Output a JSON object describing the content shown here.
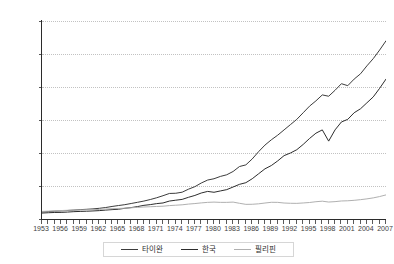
{
  "chart_data": {
    "type": "line",
    "title": "",
    "xlabel": "",
    "ylabel": "",
    "ylim": [
      0,
      30000
    ],
    "xlim": [
      1953,
      2007
    ],
    "grid": true,
    "legend_position": "bottom-center",
    "y_ticks": [
      "0",
      "5,000",
      "10,000",
      "15,000",
      "20,000",
      "25,000",
      "30,000"
    ],
    "y_tick_values": [
      0,
      5000,
      10000,
      15000,
      20000,
      25000,
      30000
    ],
    "x_tick_labels": [
      "1953",
      "1956",
      "1959",
      "1962",
      "1965",
      "1968",
      "1971",
      "1974",
      "1977",
      "1980",
      "1983",
      "1986",
      "1989",
      "1992",
      "1995",
      "1998",
      "2001",
      "2004",
      "2007"
    ],
    "x_tick_values": [
      1953,
      1956,
      1959,
      1962,
      1965,
      1968,
      1971,
      1974,
      1977,
      1980,
      1983,
      1986,
      1989,
      1992,
      1995,
      1998,
      2001,
      2004,
      2007
    ],
    "x": [
      1953,
      1954,
      1955,
      1956,
      1957,
      1958,
      1959,
      1960,
      1961,
      1962,
      1963,
      1964,
      1965,
      1966,
      1967,
      1968,
      1969,
      1970,
      1971,
      1972,
      1973,
      1974,
      1975,
      1976,
      1977,
      1978,
      1979,
      1980,
      1981,
      1982,
      1983,
      1984,
      1985,
      1986,
      1987,
      1988,
      1989,
      1990,
      1991,
      1992,
      1993,
      1994,
      1995,
      1996,
      1997,
      1998,
      1999,
      2000,
      2001,
      2002,
      2003,
      2004,
      2005,
      2006,
      2007
    ],
    "series": [
      {
        "name": "타이완",
        "color": "#3c3c3c",
        "values": [
          1080,
          1130,
          1190,
          1230,
          1290,
          1350,
          1420,
          1470,
          1530,
          1620,
          1740,
          1900,
          2040,
          2170,
          2350,
          2530,
          2720,
          2950,
          3220,
          3530,
          3870,
          3900,
          4060,
          4520,
          4900,
          5450,
          5900,
          6100,
          6450,
          6700,
          7200,
          7950,
          8200,
          9100,
          10200,
          11200,
          12000,
          12700,
          13500,
          14300,
          15100,
          16100,
          17100,
          17900,
          18800,
          18600,
          19500,
          20500,
          20200,
          21200,
          22000,
          23200,
          24300,
          25600,
          27000
        ]
      },
      {
        "name": "한국",
        "color": "#2d2d2d",
        "values": [
          900,
          950,
          990,
          1000,
          1050,
          1110,
          1150,
          1180,
          1220,
          1270,
          1350,
          1420,
          1480,
          1620,
          1730,
          1880,
          2070,
          2180,
          2330,
          2430,
          2720,
          2850,
          2970,
          3290,
          3570,
          3940,
          4180,
          4050,
          4250,
          4450,
          4850,
          5250,
          5500,
          6100,
          6850,
          7600,
          8100,
          8800,
          9600,
          10000,
          10500,
          11300,
          12200,
          13000,
          13500,
          11800,
          13500,
          14700,
          15100,
          16100,
          16700,
          17600,
          18500,
          19800,
          21200
        ]
      },
      {
        "name": "필리핀",
        "color": "#b0b0b0",
        "values": [
          1150,
          1190,
          1230,
          1280,
          1320,
          1350,
          1370,
          1390,
          1420,
          1450,
          1510,
          1560,
          1600,
          1640,
          1700,
          1760,
          1820,
          1860,
          1900,
          1940,
          2030,
          2090,
          2150,
          2260,
          2340,
          2440,
          2520,
          2560,
          2520,
          2520,
          2560,
          2380,
          2220,
          2230,
          2300,
          2420,
          2530,
          2520,
          2420,
          2380,
          2370,
          2430,
          2500,
          2620,
          2700,
          2570,
          2630,
          2730,
          2760,
          2830,
          2930,
          3050,
          3200,
          3400,
          3650
        ]
      }
    ]
  },
  "legend": {
    "entries": [
      {
        "label": "타이완",
        "color": "#3c3c3c"
      },
      {
        "label": "한국",
        "color": "#2d2d2d"
      },
      {
        "label": "필리핀",
        "color": "#b0b0b0"
      }
    ]
  }
}
